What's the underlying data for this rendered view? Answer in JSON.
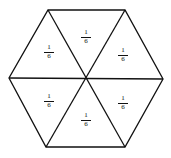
{
  "diagram": {
    "shape": "regular hexagon divided into 6 equal triangles",
    "stroke_color": "#111111",
    "vertices": [
      [
        48,
        10
      ],
      [
        125,
        10
      ],
      [
        163,
        79
      ],
      [
        125,
        147
      ],
      [
        46,
        147
      ],
      [
        9,
        78
      ]
    ],
    "center": [
      86,
      78
    ],
    "regions": [
      {
        "id": "top",
        "numerator": "1",
        "denominator": "6",
        "x": 86,
        "y": 29
      },
      {
        "id": "upper-left",
        "numerator": "1",
        "denominator": "6",
        "x": 49,
        "y": 44
      },
      {
        "id": "upper-right",
        "numerator": "1",
        "denominator": "6",
        "x": 123,
        "y": 47
      },
      {
        "id": "lower-left",
        "numerator": "1",
        "denominator": "6",
        "x": 49,
        "y": 93
      },
      {
        "id": "lower-right",
        "numerator": "1",
        "denominator": "6",
        "x": 123,
        "y": 95
      },
      {
        "id": "bottom",
        "numerator": "1",
        "denominator": "6",
        "x": 86,
        "y": 112
      }
    ]
  }
}
